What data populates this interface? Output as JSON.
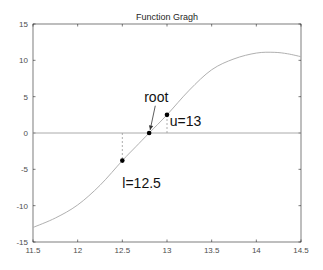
{
  "chart_data": {
    "type": "line",
    "title": "Function Gragh",
    "xlabel": "",
    "ylabel": "",
    "xlim": [
      11.5,
      14.5
    ],
    "ylim": [
      -15,
      15
    ],
    "grid": false,
    "xticks": [
      11.5,
      12,
      12.5,
      13,
      13.5,
      14,
      14.5
    ],
    "xtick_labels": [
      "11.5",
      "12",
      "12.5",
      "13",
      "13.5",
      "14",
      "14.5"
    ],
    "yticks": [
      15,
      10,
      5,
      0,
      -5,
      -10,
      -15
    ],
    "ytick_labels": [
      "15",
      "10",
      "5",
      "0",
      "-5",
      "-10",
      "-15"
    ],
    "series": [
      {
        "name": "f(x)",
        "color": "#b0b0b0",
        "x": [
          11.5,
          11.75,
          12.0,
          12.25,
          12.5,
          12.65,
          12.8,
          13.0,
          13.25,
          13.5,
          13.75,
          14.0,
          14.2,
          14.35,
          14.5
        ],
        "y": [
          -13.0,
          -11.7,
          -9.9,
          -7.2,
          -3.8,
          -1.9,
          0.0,
          2.5,
          5.9,
          8.7,
          10.2,
          11.0,
          11.1,
          10.9,
          10.5
        ]
      }
    ],
    "zero_line": {
      "y": 0,
      "color": "#a0a0a0"
    },
    "points": [
      {
        "name": "l",
        "x": 12.5,
        "y": -3.8,
        "label": "l=12.5"
      },
      {
        "name": "root",
        "x": 12.8,
        "y": 0.0,
        "label": "root"
      },
      {
        "name": "u",
        "x": 13.0,
        "y": 2.5,
        "label": "u=13"
      }
    ],
    "annotations": [
      {
        "text": "root",
        "x": 12.88,
        "y": 4.3,
        "arrow_to": [
          12.8,
          0.0
        ]
      },
      {
        "text": "l=12.5",
        "x": 12.5,
        "y": -7.5
      },
      {
        "text": "u=13",
        "x": 13.03,
        "y": 0.9
      }
    ]
  }
}
